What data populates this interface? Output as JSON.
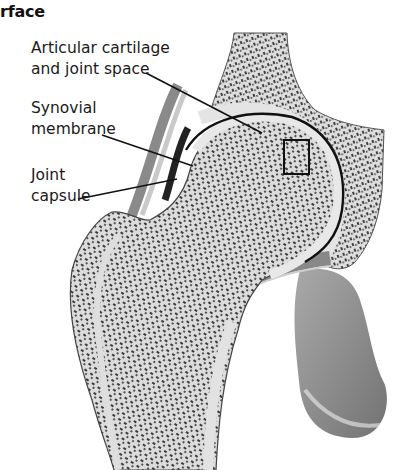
{
  "heading": "rface",
  "labels": [
    {
      "id": "articular-cartilage",
      "lines": [
        "Articular cartilage",
        "and joint space"
      ]
    },
    {
      "id": "synovial-membrane",
      "lines": [
        "Synovial",
        "membrane"
      ]
    },
    {
      "id": "joint-capsule",
      "lines": [
        "Joint",
        "capsule"
      ]
    }
  ],
  "figure": {
    "highlight_box": {
      "x": 284,
      "y": 140,
      "width": 25,
      "height": 34
    }
  },
  "colors": {
    "line": "#111111",
    "bone_fill": "#d9d9d9",
    "trabecular": "#3a3a3a",
    "cartilage": "#e6e6e6"
  }
}
